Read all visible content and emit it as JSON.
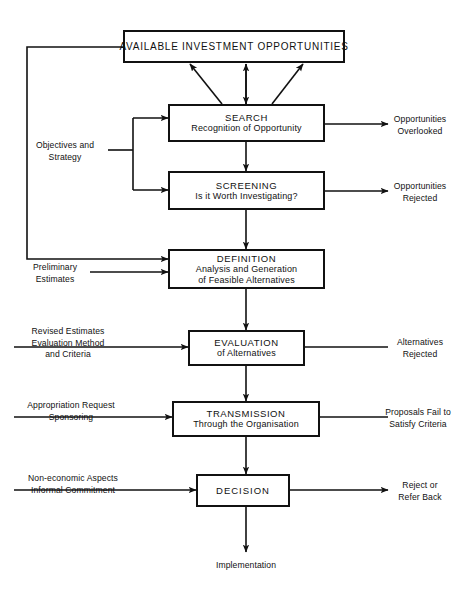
{
  "diagram": {
    "line_color": "#111111",
    "background_color": "#ffffff",
    "nodes": [
      {
        "id": "available",
        "lines": [
          "AVAILABLE INVESTMENT OPPORTUNITIES"
        ]
      },
      {
        "id": "search",
        "lines": [
          "SEARCH",
          "Recognition of Opportunity"
        ]
      },
      {
        "id": "screening",
        "lines": [
          "SCREENING",
          "Is it Worth Investigating?"
        ]
      },
      {
        "id": "definition",
        "lines": [
          "DEFINITION",
          "Analysis and Generation",
          "of Feasible Alternatives"
        ]
      },
      {
        "id": "evaluation",
        "lines": [
          "EVALUATION",
          "of Alternatives"
        ]
      },
      {
        "id": "transmission",
        "lines": [
          "TRANSMISSION",
          "Through the Organisation"
        ]
      },
      {
        "id": "decision",
        "lines": [
          "DECISION"
        ]
      }
    ],
    "left_labels": [
      {
        "id": "objectives",
        "lines": [
          "Objectives and",
          "Strategy"
        ]
      },
      {
        "id": "preliminary",
        "lines": [
          "Preliminary",
          "Estimates"
        ]
      },
      {
        "id": "revised",
        "lines": [
          "Revised Estimates",
          "Evaluation Method",
          "and Criteria"
        ]
      },
      {
        "id": "appropriation",
        "lines": [
          "Appropriation Request",
          "Sponsoring"
        ]
      },
      {
        "id": "noneconomic",
        "lines": [
          "Non-economic Aspects",
          "Informal Commitment"
        ]
      }
    ],
    "right_labels": [
      {
        "id": "overlooked",
        "lines": [
          "Opportunities",
          "Overlooked"
        ]
      },
      {
        "id": "rejected",
        "lines": [
          "Opportunities",
          "Rejected"
        ]
      },
      {
        "id": "alt-rejected",
        "lines": [
          "Alternatives",
          "Rejected"
        ]
      },
      {
        "id": "proposals-fail",
        "lines": [
          "Proposals Fail to",
          "Satisfy Criteria"
        ]
      },
      {
        "id": "reject-refer",
        "lines": [
          "Reject or",
          "Refer Back"
        ]
      }
    ],
    "bottom_label": {
      "id": "implementation",
      "text": "Implementation"
    }
  }
}
